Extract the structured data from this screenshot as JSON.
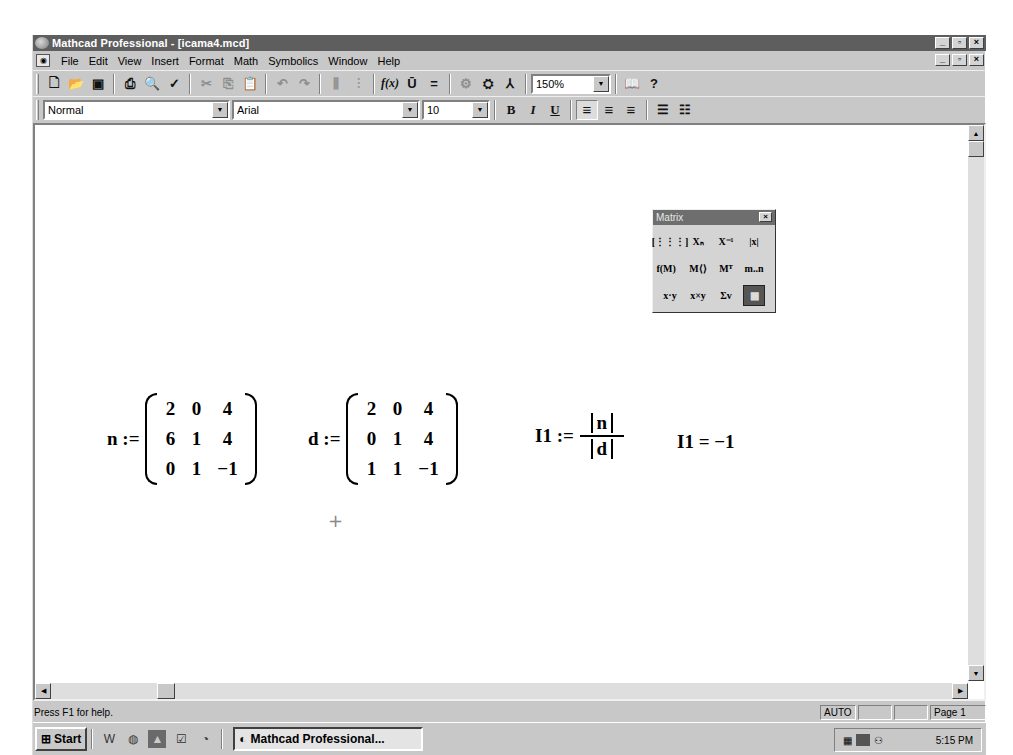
{
  "window": {
    "title": "Mathcad Professional - [icama4.mcd]",
    "controls": {
      "minimize": "_",
      "maximize": "▫",
      "close": "×"
    }
  },
  "menubar": {
    "items": [
      {
        "label": "File",
        "mnemonic": "F"
      },
      {
        "label": "Edit",
        "mnemonic": "E"
      },
      {
        "label": "View",
        "mnemonic": "V"
      },
      {
        "label": "Insert",
        "mnemonic": "I"
      },
      {
        "label": "Format",
        "mnemonic": "o"
      },
      {
        "label": "Math",
        "mnemonic": "M"
      },
      {
        "label": "Symbolics",
        "mnemonic": "S"
      },
      {
        "label": "Window",
        "mnemonic": "W"
      },
      {
        "label": "Help",
        "mnemonic": "H"
      }
    ]
  },
  "toolbar": {
    "new": "🗋",
    "open": "📂",
    "save": "▣",
    "print": "⎙",
    "print_preview": "🔍",
    "spell_check": "✓",
    "cut": "✂",
    "copy": "⎘",
    "paste": "📋",
    "undo": "↶",
    "redo": "↷",
    "align_across": "⫼",
    "align_down": "⫶",
    "insert_function": "f(x)",
    "insert_unit": "Ū",
    "calculate": "=",
    "insert_component": "⚙",
    "insert_hyperlink": "⛭",
    "resource_center_tree": "⅄",
    "zoom_value": "150%",
    "resource_center": "📖",
    "help": "?"
  },
  "format_bar": {
    "style": "Normal",
    "font": "Arial",
    "size": "10",
    "bold": "B",
    "italic": "I",
    "underline": "U",
    "align_left": "≡",
    "align_center": "≡",
    "align_right": "≡",
    "bullets": "☰",
    "numbering": "☷"
  },
  "document": {
    "expr_n": {
      "lhs": "n :=",
      "matrix": [
        [
          "2",
          "0",
          "4"
        ],
        [
          "6",
          "1",
          "4"
        ],
        [
          "0",
          "1",
          "−1"
        ]
      ]
    },
    "expr_d": {
      "lhs": "d :=",
      "matrix": [
        [
          "2",
          "0",
          "4"
        ],
        [
          "0",
          "1",
          "4"
        ],
        [
          "1",
          "1",
          "−1"
        ]
      ]
    },
    "expr_i1_def": {
      "lhs": "I1 :=",
      "numerator": "n",
      "denominator": "d"
    },
    "expr_i1_eval": {
      "text": "I1 = −1"
    },
    "crosshair": "+"
  },
  "matrix_palette": {
    "title": "Matrix",
    "close": "×",
    "buttons": [
      {
        "name": "insert-matrix",
        "glyph": "[⋮⋮⋮]"
      },
      {
        "name": "subscript",
        "glyph": "Xₙ"
      },
      {
        "name": "inverse",
        "glyph": "X⁻¹"
      },
      {
        "name": "determinant",
        "glyph": "|x|"
      },
      {
        "name": "vectorize",
        "glyph": "f(M)⃗"
      },
      {
        "name": "matrix-column",
        "glyph": "M⟨⟩"
      },
      {
        "name": "transpose",
        "glyph": "Mᵀ"
      },
      {
        "name": "range-variable",
        "glyph": "m..n"
      },
      {
        "name": "dot-product",
        "glyph": "x·y"
      },
      {
        "name": "cross-product",
        "glyph": "x×y"
      },
      {
        "name": "vector-sum",
        "glyph": "Σv"
      },
      {
        "name": "picture",
        "glyph": "▩"
      }
    ]
  },
  "statusbar": {
    "help_text": "Press F1 for help.",
    "mode": "AUTO",
    "panel2": "",
    "panel3": "",
    "page": "Page 1"
  },
  "taskbar": {
    "start_label": "Start",
    "task_label": "Mathcad Professional...",
    "clock": "5:15 PM"
  }
}
